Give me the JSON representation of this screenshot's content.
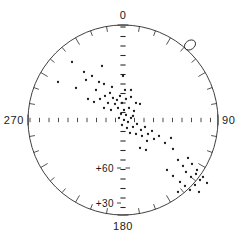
{
  "chart_data": {
    "type": "scatter",
    "title": "",
    "subtitle": "",
    "projection": "polar-stereographic",
    "xlabel": "",
    "ylabel": "",
    "grid": true,
    "legend_position": "none",
    "center_px": [
      123,
      120
    ],
    "radius_px": 95,
    "azimuth_labels": [
      {
        "name": "north-label",
        "text": "0",
        "angle_deg": 0
      },
      {
        "name": "east-label",
        "text": "90",
        "angle_deg": 90
      },
      {
        "name": "south-label",
        "text": "180",
        "angle_deg": 180
      },
      {
        "name": "west-label",
        "text": "270",
        "angle_deg": 270
      }
    ],
    "radial_labels": [
      {
        "name": "elevation-60-label",
        "text": "+60",
        "value": 60
      },
      {
        "name": "elevation-30-label",
        "text": "+30",
        "value": 30
      }
    ],
    "rim_tick_count": 36,
    "rim_tick_step_deg": 10,
    "axis_tick_step_px": 9.5,
    "highlight_marker": {
      "name": "circled-point",
      "x_px": 190,
      "y_px": 45,
      "rx": 6,
      "ry": 4.5,
      "rotation_deg": -35
    },
    "point_color": "#1a1a1a",
    "line_color": "#2a2a2a",
    "background_color": "#ffffff",
    "points_px": [
      [
        72,
        62
      ],
      [
        102,
        66
      ],
      [
        84,
        72
      ],
      [
        58,
        82
      ],
      [
        86,
        80
      ],
      [
        92,
        76
      ],
      [
        76,
        88
      ],
      [
        99,
        82
      ],
      [
        104,
        84
      ],
      [
        96,
        90
      ],
      [
        123,
        76
      ],
      [
        112,
        87
      ],
      [
        110,
        93
      ],
      [
        125,
        90
      ],
      [
        131,
        90
      ],
      [
        105,
        96
      ],
      [
        113,
        98
      ],
      [
        100,
        99
      ],
      [
        117,
        100
      ],
      [
        120,
        96
      ],
      [
        88,
        99
      ],
      [
        94,
        102
      ],
      [
        108,
        103
      ],
      [
        115,
        104
      ],
      [
        122,
        103
      ],
      [
        126,
        99
      ],
      [
        131,
        97
      ],
      [
        136,
        103
      ],
      [
        104,
        108
      ],
      [
        111,
        110
      ],
      [
        118,
        108
      ],
      [
        124,
        110
      ],
      [
        129,
        108
      ],
      [
        134,
        111
      ],
      [
        140,
        104
      ],
      [
        121,
        114
      ],
      [
        126,
        115
      ],
      [
        133,
        116
      ],
      [
        119,
        118
      ],
      [
        124,
        120
      ],
      [
        128,
        122
      ],
      [
        131,
        118
      ],
      [
        122,
        125
      ],
      [
        127,
        128
      ],
      [
        133,
        127
      ],
      [
        137,
        124
      ],
      [
        141,
        130
      ],
      [
        145,
        127
      ],
      [
        130,
        133
      ],
      [
        136,
        134
      ],
      [
        142,
        136
      ],
      [
        148,
        134
      ],
      [
        152,
        131
      ],
      [
        147,
        141
      ],
      [
        154,
        139
      ],
      [
        159,
        136
      ],
      [
        165,
        143
      ],
      [
        171,
        138
      ],
      [
        140,
        148
      ],
      [
        146,
        150
      ],
      [
        173,
        149
      ],
      [
        178,
        160
      ],
      [
        183,
        166
      ],
      [
        188,
        158
      ],
      [
        192,
        164
      ],
      [
        197,
        170
      ],
      [
        186,
        172
      ],
      [
        191,
        177
      ],
      [
        196,
        174
      ],
      [
        200,
        180
      ],
      [
        180,
        182
      ],
      [
        185,
        186
      ],
      [
        190,
        190
      ],
      [
        195,
        185
      ],
      [
        199,
        192
      ],
      [
        173,
        176
      ],
      [
        167,
        170
      ],
      [
        203,
        177
      ],
      [
        207,
        183
      ],
      [
        178,
        192
      ]
    ]
  }
}
